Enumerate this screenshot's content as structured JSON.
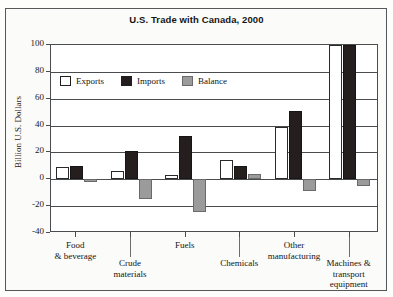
{
  "chart_data": {
    "type": "bar",
    "title": "U.S. Trade with Canada, 2000",
    "xlabel": "",
    "ylabel": "Billion U.S. Dollars",
    "ylim": [
      -40,
      100
    ],
    "yticks": [
      100,
      80,
      60,
      40,
      20,
      0,
      -20,
      -40
    ],
    "ytick_labels": [
      "100",
      "80",
      "60",
      "40",
      "20",
      "0",
      "-20",
      "-40"
    ],
    "grid": true,
    "legend_position": "upper-left-inside",
    "categories": [
      "Food\n& beverage",
      "Crude\nmaterials",
      "Fuels",
      "Chemicals",
      "Other\nmanufacturing",
      "Machines &\ntransport\nequipment"
    ],
    "category_lines": [
      [
        "Food",
        "& beverage"
      ],
      [
        "Crude",
        "materials"
      ],
      [
        "Fuels"
      ],
      [
        "Chemicals"
      ],
      [
        "Other",
        "manufacturing"
      ],
      [
        "Machines &",
        "transport",
        "equipment"
      ]
    ],
    "series": [
      {
        "name": "Exports",
        "color": "#ffffff",
        "values": [
          9,
          6,
          3,
          14,
          39,
          112
        ]
      },
      {
        "name": "Imports",
        "color": "#241f1e",
        "values": [
          10,
          21,
          32,
          10,
          51,
          118
        ]
      },
      {
        "name": "Balance",
        "color": "#9b9b9b",
        "values": [
          -2,
          -15,
          -24,
          4,
          -9,
          -5
        ]
      }
    ]
  },
  "legend": {
    "items": [
      {
        "label": "Exports"
      },
      {
        "label": "Imports"
      },
      {
        "label": "Balance"
      }
    ]
  }
}
